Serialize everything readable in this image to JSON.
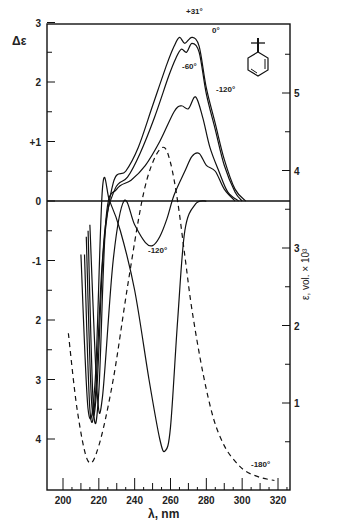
{
  "chart_data": {
    "type": "line",
    "title": "",
    "xlabel": "λ, nm",
    "ylabel_left": "Δε",
    "ylabel_right": "ε, vol. × 10³",
    "xlim": [
      195,
      330
    ],
    "ylim_left": [
      -4.4,
      3
    ],
    "ylim_right": [
      0,
      5.9
    ],
    "x_ticks": [
      200,
      220,
      240,
      260,
      280,
      300,
      320
    ],
    "y_ticks_left": [
      {
        "value": 3,
        "label": "3"
      },
      {
        "value": 2,
        "label": "2"
      },
      {
        "value": 1,
        "label": "+1"
      },
      {
        "value": 0,
        "label": "0"
      },
      {
        "value": -1,
        "label": "-1"
      },
      {
        "value": -2,
        "label": "2"
      },
      {
        "value": -3,
        "label": "3"
      },
      {
        "value": -4,
        "label": "4"
      }
    ],
    "y_ticks_right": [
      1,
      2,
      3,
      4,
      5
    ],
    "grid": false,
    "legend": "inline curve labels",
    "annotations": [
      "+31°",
      "0°",
      "-60°",
      "-120°",
      "-120°",
      "-180°"
    ],
    "structure_inset": "tert-butyl-cyclohexadiene",
    "series": [
      {
        "name": "+31°",
        "axis": "left",
        "style": "solid",
        "x": [
          212,
          215,
          218,
          222,
          228,
          235,
          242,
          250,
          258,
          262,
          265,
          268,
          272,
          276,
          280,
          285,
          290,
          296,
          302
        ],
        "y": [
          -0.9,
          -3.5,
          -3.3,
          -1.0,
          0.3,
          0.5,
          0.9,
          1.6,
          2.3,
          2.6,
          2.75,
          2.65,
          2.75,
          2.6,
          1.9,
          1.3,
          0.7,
          0.2,
          0.0
        ]
      },
      {
        "name": "0°",
        "axis": "left",
        "style": "solid",
        "x": [
          213,
          216,
          219,
          223,
          229,
          236,
          243,
          251,
          259,
          263,
          266,
          269,
          272,
          276,
          280,
          285,
          290,
          296,
          300
        ],
        "y": [
          -0.6,
          -3.4,
          -3.1,
          -0.6,
          0.2,
          0.4,
          0.8,
          1.4,
          2.1,
          2.4,
          2.55,
          2.5,
          2.65,
          2.5,
          1.8,
          1.2,
          0.6,
          0.15,
          0.0
        ]
      },
      {
        "name": "-60°",
        "axis": "left",
        "style": "solid",
        "x": [
          214,
          217,
          220,
          224,
          230,
          238,
          246,
          254,
          262,
          266,
          270,
          274,
          278,
          282,
          287,
          292,
          298
        ],
        "y": [
          -0.5,
          -3.5,
          -3.2,
          -0.3,
          0.2,
          0.35,
          0.6,
          1.0,
          1.5,
          1.6,
          1.55,
          1.75,
          1.4,
          0.9,
          0.5,
          0.15,
          0.0
        ]
      },
      {
        "name": "-120°",
        "axis": "left",
        "style": "solid",
        "x": [
          215,
          219,
          222,
          228,
          234,
          240,
          246,
          250,
          254,
          258,
          262,
          268,
          272,
          276,
          280,
          285,
          290,
          296
        ],
        "y": [
          -0.4,
          -3.2,
          -3.3,
          -1.0,
          0.0,
          -0.4,
          -0.7,
          -0.75,
          -0.6,
          -0.3,
          0.1,
          0.5,
          0.75,
          0.8,
          0.6,
          0.5,
          0.2,
          0.0
        ]
      },
      {
        "name": "-180°",
        "axis": "left",
        "style": "solid",
        "x": [
          210,
          214,
          218,
          222,
          226,
          232,
          240,
          248,
          254,
          257,
          260,
          264,
          268,
          274,
          280
        ],
        "y": [
          -0.9,
          -3.5,
          -3.0,
          0.2,
          0.0,
          -0.5,
          -1.5,
          -3.0,
          -4.0,
          -4.2,
          -3.8,
          -2.0,
          -0.5,
          -0.05,
          0.0
        ]
      },
      {
        "name": "UV absorption",
        "axis": "right",
        "style": "dashed",
        "x": [
          203,
          208,
          214,
          220,
          228,
          236,
          244,
          250,
          256,
          260,
          264,
          268,
          272,
          278,
          284,
          290,
          296,
          302,
          310,
          318
        ],
        "y": [
          1.9,
          0.9,
          0.25,
          0.45,
          1.3,
          2.5,
          3.6,
          4.1,
          4.3,
          4.1,
          3.6,
          2.9,
          2.2,
          1.4,
          0.8,
          0.45,
          0.25,
          0.12,
          0.04,
          0.0
        ]
      }
    ]
  },
  "labels": {
    "ylabel_left": "Δε",
    "ylabel_right": "ε, vol. × 10³",
    "xlabel": "λ, nm"
  }
}
